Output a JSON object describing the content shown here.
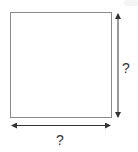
{
  "diagram": {
    "shape": "square",
    "colors": {
      "outline": "#8a8a8a",
      "arrow": "#333333",
      "text": "#333333",
      "background": "#ffffff"
    },
    "square": {
      "x": 10,
      "y": 12,
      "width": 101,
      "height": 105
    },
    "height_arrow": {
      "x": 118,
      "y1": 13,
      "y2": 118,
      "label": "?"
    },
    "width_arrow": {
      "y": 125,
      "x1": 11,
      "x2": 111,
      "label": "?"
    }
  }
}
